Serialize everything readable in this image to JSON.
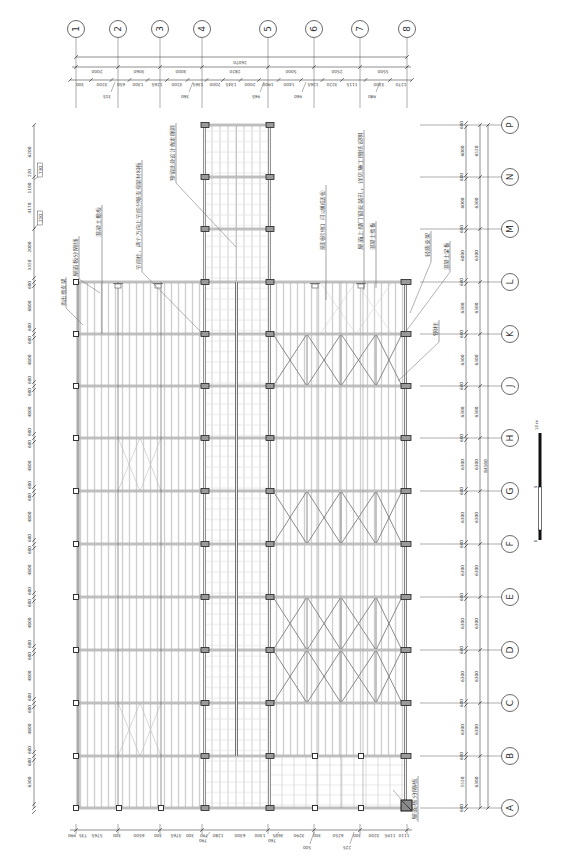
{
  "grid_axes": {
    "columns": [
      "1",
      "2",
      "3",
      "4",
      "5",
      "6",
      "7",
      "8"
    ],
    "rows": [
      "P",
      "N",
      "M",
      "L",
      "K",
      "J",
      "H",
      "G",
      "F",
      "E",
      "D",
      "C",
      "B",
      "A"
    ]
  },
  "dimensions": {
    "top": {
      "overall": "26070",
      "bays": [
        "2000",
        "3060",
        "3000",
        "2820",
        "5000",
        "2500",
        "5500"
      ],
      "details": [
        "300",
        "3200",
        "650",
        "1300",
        "1265",
        "3200",
        "1365",
        "2000",
        "1345",
        "2000",
        "1900",
        "1400",
        "1265",
        "3220",
        "1115",
        "3300",
        "1270"
      ],
      "offsets": [
        "315",
        "360",
        "965",
        "960",
        "980"
      ]
    },
    "left": {
      "segments": [
        "6200",
        "220",
        "1100",
        "4170",
        "2000",
        "3350",
        "600",
        "6800",
        "600",
        "600",
        "4800",
        "600",
        "600",
        "4800",
        "600",
        "600",
        "4800",
        "600",
        "600",
        "4800",
        "600",
        "600",
        "4800",
        "600",
        "600",
        "4800",
        "600",
        "600",
        "4800",
        "600",
        "600",
        "4800",
        "600",
        "600",
        "6300"
      ],
      "boxed": [
        "730",
        "250"
      ]
    },
    "right": {
      "row_marks": [
        "600",
        "600",
        "600",
        "600",
        "600",
        "600",
        "600",
        "600",
        "600",
        "600",
        "600",
        "600",
        "600",
        "600"
      ],
      "outer": [
        "6000",
        "6000",
        "6000",
        "6300",
        "6300",
        "6300",
        "6300",
        "6300",
        "6300",
        "6300",
        "6300",
        "6300",
        "5520"
      ],
      "inner": [
        "6520",
        "6300",
        "6300",
        "6300",
        "6300",
        "6300",
        "6300",
        "6300",
        "6300",
        "6300",
        "6300",
        "6300",
        "6300"
      ],
      "overall": "84560"
    },
    "bottom": {
      "segments": [
        "990",
        "735",
        "5765",
        "300",
        "6500",
        "300",
        "3765",
        "300",
        "790",
        "1280",
        "6300",
        "1300",
        "3655",
        "3290",
        "300",
        "6250",
        "300",
        "3200",
        "1195",
        "1110"
      ],
      "offsets": [
        "790",
        "760",
        "500",
        "225"
      ]
    }
  },
  "annotations": [
    "挑出檐支架",
    "屋面板分隔线",
    "混凝土檐板",
    "节能柱，两个方向上节能分隔支撑架材料板",
    "预留此处设计做走廊洞",
    "屋面板检修口（可以做成盖板）",
    "屋面上部门窗安装孔，详见施工图纸说明",
    "混凝土檐板",
    "轻质支架",
    "混凝土梁板",
    "钢柱",
    "屋面板分隔板"
  ],
  "scale_bar": {
    "max_label": "10 m",
    "mid_label": "5",
    "zero_label": "0"
  },
  "colors": {
    "line": "#333333",
    "beam": "#8a8a8a",
    "purlin": "#cfcfcf",
    "bracing": "#777777",
    "light_bracing": "#bdbdbd",
    "column_fill": "#9a9a9a"
  }
}
